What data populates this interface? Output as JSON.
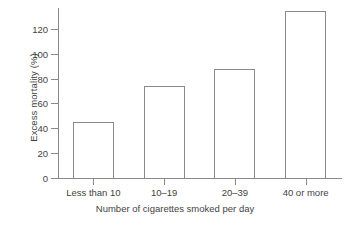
{
  "chart_data": {
    "type": "bar",
    "title": "",
    "xlabel": "Number of cigarettes smoked per day",
    "ylabel": "Excess mortality (%)",
    "categories": [
      "Less than 10",
      "10–19",
      "20–39",
      "40 or more"
    ],
    "values": [
      45,
      74,
      88,
      134
    ],
    "ylim": [
      0,
      140
    ],
    "yticks": [
      0,
      20,
      40,
      60,
      80,
      100,
      120
    ],
    "ytick_labels": [
      "0",
      "20",
      "40",
      "60",
      "80",
      "100",
      "120"
    ],
    "grid": false,
    "legend": null,
    "bar_style": {
      "fill": "none",
      "edge_color": "#8a8a8a"
    },
    "axis_color": "#8a8a8a",
    "text_color": "#3f3f3f",
    "background": "#ffffff"
  }
}
